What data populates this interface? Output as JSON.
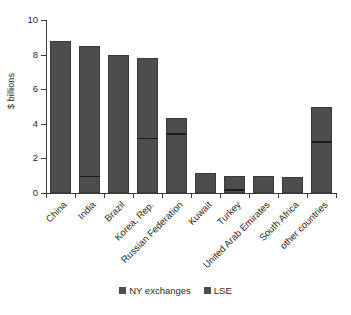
{
  "chart_data": {
    "type": "bar",
    "stacked": true,
    "title": "",
    "xlabel": "",
    "ylabel": "$ billions",
    "ylim": [
      0,
      10
    ],
    "yticks": [
      0,
      2,
      4,
      6,
      8,
      10
    ],
    "ytick_labels": [
      "0",
      "2",
      "4",
      "6",
      "8",
      "10"
    ],
    "grid": false,
    "legend_position": "bottom-center",
    "categories": [
      "China",
      "India",
      "Brazil",
      "Korea, Rep.",
      "Russian Federation",
      "Kuwait",
      "Turkey",
      "United Arab Emirates",
      "South Africa",
      "other countries"
    ],
    "series": [
      {
        "name": "NY exchanges",
        "color": "#4d4d4d",
        "values": [
          8.8,
          7.65,
          8.0,
          4.75,
          1.05,
          1.15,
          0.92,
          1.0,
          0.95,
          2.15
        ]
      },
      {
        "name": "LSE",
        "color": "#4d4d4d",
        "values": [
          0.0,
          0.85,
          0.0,
          3.05,
          3.3,
          0.0,
          0.08,
          0.0,
          0.0,
          2.85
        ]
      }
    ],
    "totals": [
      8.8,
      8.5,
      8.0,
      7.8,
      4.35,
      1.15,
      1.0,
      1.0,
      0.95,
      5.0
    ]
  },
  "legend": {
    "items": [
      {
        "label": "NY exchanges"
      },
      {
        "label": "LSE"
      }
    ]
  },
  "axis": {
    "y_title": "$ billions"
  }
}
